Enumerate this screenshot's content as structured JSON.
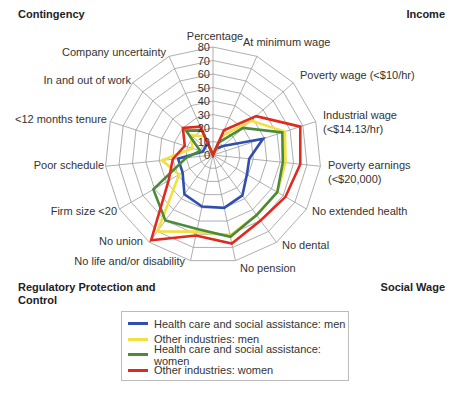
{
  "quadrants": {
    "top_left": "Contingency",
    "top_right": "Income",
    "bottom_left": "Regulatory Protection and Control",
    "bottom_right": "Social Wage"
  },
  "chart_data": {
    "type": "radar",
    "title": "",
    "scale_label": "Percentage",
    "rmin": 0,
    "rmax": 80,
    "ticks": [
      0,
      10,
      20,
      30,
      40,
      50,
      60,
      70,
      80
    ],
    "grid": true,
    "legend_position": "bottom",
    "categories": [
      "At minimum wage",
      "Poverty wage (<$10/hr)",
      "Industrial wage (<$14.13/hr)",
      "Poverty earnings (<$20,000)",
      "No extended health",
      "No dental",
      "No pension",
      "No life and/or disability",
      "No union",
      "Firm size <20",
      "Poor schedule",
      "<12 months tenure",
      "In and out of work",
      "Company uncertainty"
    ],
    "series": [
      {
        "name": "Health care and social assistance: men",
        "color": "#2f4fb0",
        "values": [
          5,
          10,
          39,
          27,
          29,
          37,
          40,
          39,
          36,
          26,
          26,
          8,
          8,
          10
        ]
      },
      {
        "name": "Other industries: men",
        "color": "#f0e040",
        "values": [
          15,
          38,
          56,
          54,
          55,
          55,
          61,
          58,
          70,
          29,
          38,
          16,
          22,
          15
        ]
      },
      {
        "name": "Health care and social assistance: women",
        "color": "#4a8a3a",
        "values": [
          10,
          30,
          54,
          52,
          55,
          55,
          62,
          56,
          60,
          51,
          20,
          10,
          27,
          20
        ]
      },
      {
        "name": "Other industries: women",
        "color": "#e02a20",
        "values": [
          20,
          43,
          68,
          65,
          62,
          60,
          67,
          61,
          78,
          38,
          30,
          22,
          30,
          23
        ]
      }
    ]
  },
  "legend": {
    "items": [
      "Health care and social assistance: men",
      "Other industries: men",
      "Health care and social assistance: women",
      "Other industries: women"
    ]
  }
}
